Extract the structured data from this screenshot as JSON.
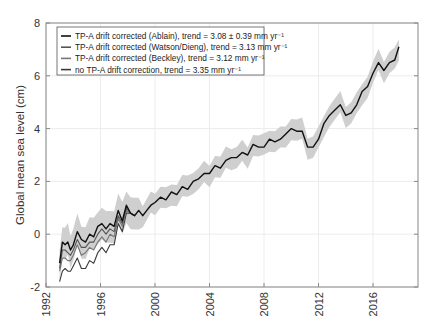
{
  "chart_data": {
    "type": "line",
    "title": "",
    "xlabel": "",
    "ylabel": "Global mean sea level (cm)",
    "xlim": [
      1992,
      2019.3
    ],
    "ylim": [
      -2,
      8
    ],
    "xticks": [
      "1992",
      "1996",
      "2000",
      "2004",
      "2008",
      "2012",
      "2016"
    ],
    "yticks": [
      "-2",
      "0",
      "2",
      "4",
      "6",
      "8"
    ],
    "grid": true,
    "legend_position": "upper left",
    "uncertainty_band": {
      "color": "#cfcfcf",
      "description": "shaded envelope around Ablain series"
    },
    "series": [
      {
        "name": "TP-A drift corrected (Ablain), trend = 3.08 ± 0.39 mm yr⁻¹",
        "color": "#111111",
        "x": [
          1993.0,
          1993.2,
          1993.4,
          1993.6,
          1993.8,
          1994.0,
          1994.3,
          1994.6,
          1994.9,
          1995.2,
          1995.5,
          1995.8,
          1996.1,
          1996.4,
          1996.7,
          1997.0,
          1997.3,
          1997.6,
          1997.9,
          1998.2,
          1998.5,
          1998.8,
          1999.1,
          1999.4,
          1999.7,
          2000.0,
          2000.4,
          2000.8,
          2001.2,
          2001.6,
          2002.0,
          2002.4,
          2002.8,
          2003.2,
          2003.6,
          2004.0,
          2004.4,
          2004.8,
          2005.2,
          2005.6,
          2006.0,
          2006.4,
          2006.8,
          2007.2,
          2007.6,
          2008.0,
          2008.4,
          2008.8,
          2009.2,
          2009.6,
          2010.0,
          2010.4,
          2010.8,
          2011.2,
          2011.6,
          2012.0,
          2012.4,
          2012.8,
          2013.2,
          2013.6,
          2014.0,
          2014.4,
          2014.8,
          2015.2,
          2015.6,
          2016.0,
          2016.4,
          2016.8,
          2017.2,
          2017.6,
          2017.9
        ],
        "values": [
          -1.1,
          -0.3,
          -0.4,
          -0.3,
          -0.6,
          -0.4,
          0.1,
          -0.2,
          -0.3,
          0.0,
          -0.1,
          0.3,
          0.4,
          0.2,
          0.4,
          0.3,
          0.9,
          0.5,
          1.1,
          0.8,
          0.7,
          0.9,
          0.7,
          0.9,
          1.1,
          1.2,
          1.4,
          1.3,
          1.6,
          1.5,
          1.8,
          1.7,
          2.0,
          2.1,
          2.3,
          2.3,
          2.6,
          2.5,
          2.8,
          2.9,
          2.9,
          3.1,
          3.0,
          3.4,
          3.3,
          3.3,
          3.6,
          3.5,
          3.6,
          3.8,
          4.0,
          3.9,
          3.9,
          3.3,
          3.3,
          3.6,
          4.2,
          4.5,
          4.7,
          4.9,
          4.5,
          4.6,
          4.9,
          5.4,
          5.6,
          6.1,
          6.5,
          6.2,
          6.5,
          6.6,
          7.1
        ]
      },
      {
        "name": "TP-A drift corrected (Watson/Dieng), trend = 3.13 mm yr⁻¹",
        "color": "#555555",
        "x": [
          1993.0,
          1993.2,
          1993.4,
          1993.6,
          1993.8,
          1994.0,
          1994.3,
          1994.6,
          1994.9,
          1995.2,
          1995.5,
          1995.8,
          1996.1,
          1996.4,
          1996.7,
          1997.0,
          1997.3,
          1997.6,
          1997.9,
          1998.2,
          1998.5
        ],
        "values": [
          -1.3,
          -0.6,
          -0.6,
          -0.7,
          -0.8,
          -0.6,
          -0.2,
          -0.5,
          -0.5,
          -0.3,
          -0.3,
          0.0,
          0.2,
          0.0,
          0.2,
          0.1,
          0.7,
          0.4,
          1.0,
          0.8,
          0.7
        ]
      },
      {
        "name": "TP-A drift corrected (Beckley), trend = 3.12 mm yr⁻¹",
        "color": "#777777",
        "x": [
          1993.0,
          1993.2,
          1993.4,
          1993.6,
          1993.8,
          1994.0,
          1994.3,
          1994.6,
          1994.9,
          1995.2,
          1995.5,
          1995.8,
          1996.1,
          1996.4,
          1996.7,
          1997.0,
          1997.3,
          1997.6,
          1997.9,
          1998.2,
          1998.5
        ],
        "values": [
          -1.4,
          -0.9,
          -0.9,
          -1.0,
          -1.0,
          -0.8,
          -0.4,
          -0.8,
          -0.7,
          -0.5,
          -0.6,
          -0.3,
          -0.1,
          -0.3,
          0.0,
          -0.1,
          0.6,
          0.3,
          0.9,
          0.8,
          0.7
        ]
      },
      {
        "name": "no TP-A drift correction, trend = 3.35 mm yr⁻¹",
        "color": "#3a3a3a",
        "x": [
          1993.0,
          1993.2,
          1993.4,
          1993.6,
          1993.8,
          1994.0,
          1994.3,
          1994.6,
          1994.9,
          1995.2,
          1995.5,
          1995.8,
          1996.1,
          1996.4,
          1996.7,
          1997.0,
          1997.3,
          1997.6,
          1997.9,
          1998.2,
          1998.5
        ],
        "values": [
          -1.8,
          -1.4,
          -1.3,
          -1.4,
          -1.4,
          -1.2,
          -0.9,
          -1.3,
          -1.3,
          -1.0,
          -1.1,
          -0.7,
          -0.5,
          -0.7,
          -0.4,
          -0.4,
          0.4,
          0.1,
          0.8,
          0.8,
          0.7
        ]
      }
    ]
  }
}
